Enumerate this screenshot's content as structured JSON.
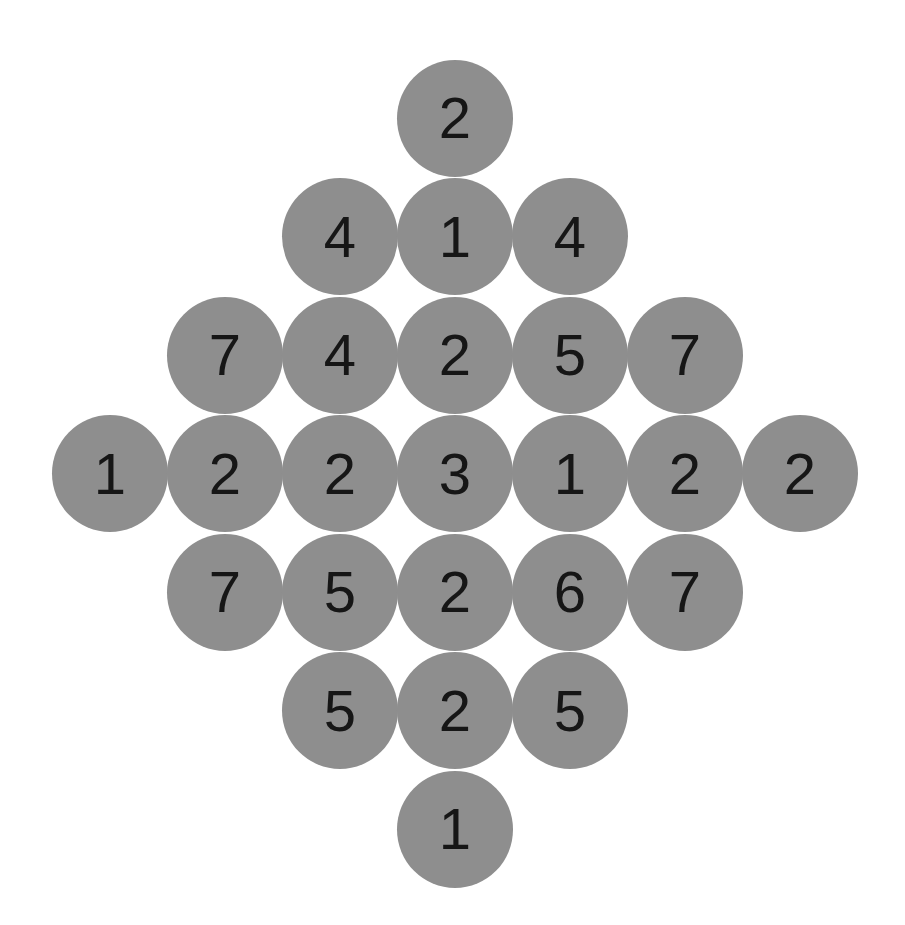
{
  "puzzle": {
    "type": "diamond number grid",
    "cell_color": "#8e8e8e",
    "text_color": "#161616",
    "rows": [
      {
        "cells": [
          {
            "col": 3,
            "value": "2"
          }
        ]
      },
      {
        "cells": [
          {
            "col": 2,
            "value": "4"
          },
          {
            "col": 3,
            "value": "1"
          },
          {
            "col": 4,
            "value": "4"
          }
        ]
      },
      {
        "cells": [
          {
            "col": 1,
            "value": "7"
          },
          {
            "col": 2,
            "value": "4"
          },
          {
            "col": 3,
            "value": "2"
          },
          {
            "col": 4,
            "value": "5"
          },
          {
            "col": 5,
            "value": "7"
          }
        ]
      },
      {
        "cells": [
          {
            "col": 0,
            "value": "1"
          },
          {
            "col": 1,
            "value": "2"
          },
          {
            "col": 2,
            "value": "2"
          },
          {
            "col": 3,
            "value": "3"
          },
          {
            "col": 4,
            "value": "1"
          },
          {
            "col": 5,
            "value": "2"
          },
          {
            "col": 6,
            "value": "2"
          }
        ]
      },
      {
        "cells": [
          {
            "col": 1,
            "value": "7"
          },
          {
            "col": 2,
            "value": "5"
          },
          {
            "col": 3,
            "value": "2"
          },
          {
            "col": 4,
            "value": "6"
          },
          {
            "col": 5,
            "value": "7"
          }
        ]
      },
      {
        "cells": [
          {
            "col": 2,
            "value": "5"
          },
          {
            "col": 3,
            "value": "2"
          },
          {
            "col": 4,
            "value": "5"
          }
        ]
      },
      {
        "cells": [
          {
            "col": 3,
            "value": "1"
          }
        ]
      }
    ]
  }
}
